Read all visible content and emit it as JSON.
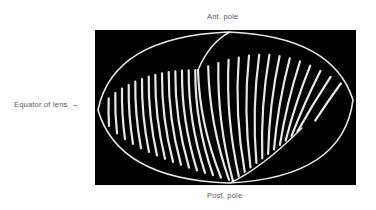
{
  "figure": {
    "labels": {
      "anterior_pole": "Ant. pole",
      "posterior_pole": "Post. pole",
      "equator": "Equator of lens",
      "equator_arrow": "→"
    },
    "image": {
      "description": "Photograph of lens fibers showing curved fiber pattern meeting at anterior and posterior sutures",
      "background": "#000000",
      "fiber_color": "#e8e8e8",
      "fiber_count": 30
    }
  }
}
